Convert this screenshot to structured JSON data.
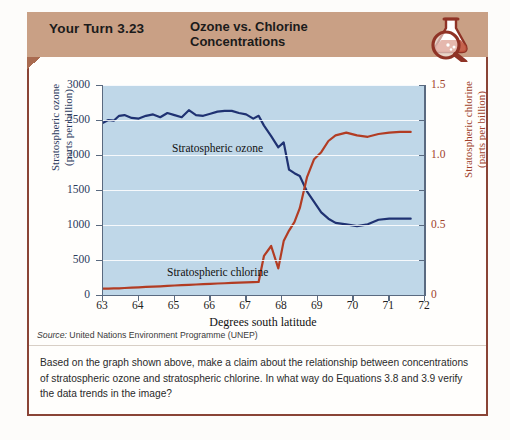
{
  "header": {
    "exercise_label": "Your Turn 3.23",
    "title_line1": "Ozone vs. Chlorine",
    "title_line2": "Concentrations",
    "icon": "flask-magnifier-icon",
    "background_color": "#c9a085"
  },
  "source_prefix": "Source:",
  "source_text": " United Nations Environment Programme (UNEP)",
  "question_text": "Based on the graph shown above, make a claim about the relationship between concentrations of stratospheric ozone and stratospheric chlorine. In what way do Equations 3.8 and 3.9 verify the data trends in the image?",
  "chart_data": {
    "type": "line",
    "title": "",
    "xlabel": "Degrees south latitude",
    "plot_background": "#bfd7e8",
    "grid": true,
    "legend_position": "inline-annotation",
    "x": [
      63,
      63.15,
      63.3,
      63.45,
      63.6,
      63.8,
      64.0,
      64.2,
      64.4,
      64.6,
      64.8,
      65.0,
      65.2,
      65.4,
      65.6,
      65.8,
      66.0,
      66.2,
      66.4,
      66.6,
      66.8,
      67.0,
      67.2,
      67.35,
      67.5,
      67.7,
      67.9,
      68.05,
      68.2,
      68.35,
      68.5,
      68.7,
      68.9,
      69.1,
      69.3,
      69.5,
      69.8,
      70.1,
      70.4,
      70.7,
      71.0,
      71.3,
      71.6
    ],
    "axes": [
      {
        "id": "left",
        "label": "Stratospheric ozone\n(parts per billion)",
        "label_line1": "Stratospheric ozone",
        "label_line2": "(parts per billion)",
        "color": "#2b3a5c",
        "ylim": [
          0,
          3000
        ],
        "ticks": [
          0,
          500,
          1000,
          1500,
          2000,
          2500,
          3000
        ],
        "tick_labels": [
          "0",
          "500",
          "1000",
          "1500",
          "2000",
          "2500",
          "3000"
        ]
      },
      {
        "id": "right",
        "label": "Stratospheric chlorine\n(parts per billion)",
        "label_line1": "Stratospheric chlorine",
        "label_line2": "(parts per billion)",
        "color": "#a0422c",
        "ylim": [
          0,
          1.5
        ],
        "ticks": [
          0,
          0.25,
          0.5,
          0.75,
          1.0,
          1.25,
          1.5
        ],
        "tick_labels": [
          "0",
          "",
          "0.5",
          "",
          "1.0",
          "",
          "1.5"
        ]
      }
    ],
    "xticks": [
      63,
      64,
      65,
      66,
      67,
      68,
      69,
      70,
      71,
      72
    ],
    "xtick_labels": [
      "63",
      "64",
      "65",
      "66",
      "67",
      "68",
      "69",
      "70",
      "71",
      "72"
    ],
    "xlim": [
      63,
      72
    ],
    "series": [
      {
        "name": "Stratospheric ozone",
        "axis": "left",
        "color": "#1f3272",
        "annotation": "Stratospheric ozone",
        "values": [
          2460,
          2500,
          2490,
          2560,
          2570,
          2530,
          2520,
          2560,
          2580,
          2540,
          2600,
          2570,
          2540,
          2640,
          2570,
          2560,
          2590,
          2620,
          2630,
          2630,
          2600,
          2580,
          2520,
          2560,
          2420,
          2270,
          2110,
          2180,
          1790,
          1740,
          1700,
          1480,
          1330,
          1180,
          1090,
          1030,
          1010,
          985,
          1010,
          1075,
          1090,
          1090,
          1090
        ]
      },
      {
        "name": "Stratospheric chlorine",
        "axis": "right",
        "color": "#b23c23",
        "annotation": "Stratospheric chlorine",
        "values": [
          0.045,
          0.046,
          0.047,
          0.048,
          0.05,
          0.052,
          0.055,
          0.058,
          0.06,
          0.062,
          0.065,
          0.068,
          0.07,
          0.072,
          0.075,
          0.077,
          0.08,
          0.082,
          0.084,
          0.086,
          0.088,
          0.09,
          0.092,
          0.093,
          0.28,
          0.35,
          0.19,
          0.385,
          0.46,
          0.52,
          0.62,
          0.84,
          0.97,
          1.02,
          1.1,
          1.14,
          1.16,
          1.14,
          1.13,
          1.15,
          1.16,
          1.165,
          1.165
        ]
      }
    ]
  }
}
